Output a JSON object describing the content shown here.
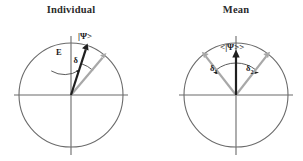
{
  "figure": {
    "width": 303,
    "height": 161,
    "background": "#ffffff",
    "type": "vector-diagram"
  },
  "colors": {
    "circle_stroke": "#6b6b6b",
    "axis_stroke": "#6b6b6b",
    "arc_stroke": "#4a4a4a",
    "vector_primary": "#1f1f1f",
    "vector_secondary": "#a8a8a8",
    "title_text": "#2b2b2b",
    "label_text": "#1a1a1a"
  },
  "panels": [
    {
      "id": "individual",
      "title": "Individual",
      "title_x": 71,
      "title_y": 13,
      "circle": {
        "cx": 71,
        "cy": 95,
        "r": 52
      },
      "axes": {
        "horizontal": {
          "x1": 14,
          "y1": 95,
          "x2": 128,
          "y2": 95
        },
        "vertical": {
          "x1": 71,
          "y1": 36,
          "x2": 71,
          "y2": 155
        }
      },
      "vectors": [
        {
          "name": "psi-vector",
          "style": "black",
          "angle_deg": 72,
          "length": 48,
          "label": "|Ψ>",
          "label_x": 84,
          "label_y": 38
        },
        {
          "name": "reference-vector",
          "style": "gray",
          "angle_deg": 48,
          "length": 50,
          "label": "",
          "label_x": 0,
          "label_y": 0
        }
      ],
      "arcs": [
        {
          "name": "E-arc",
          "label": "E",
          "label_x": 59,
          "label_y": 54,
          "r": 26,
          "start_deg": 72,
          "end_deg": 112
        },
        {
          "name": "delta-arc",
          "label": "δ",
          "label_x": 76,
          "label_y": 62,
          "r": 33,
          "start_deg": 48,
          "end_deg": 72
        }
      ]
    },
    {
      "id": "mean",
      "title": "Mean",
      "title_x": 236,
      "title_y": 13,
      "circle": {
        "cx": 236,
        "cy": 95,
        "r": 52
      },
      "axes": {
        "horizontal": {
          "x1": 179,
          "y1": 95,
          "x2": 293,
          "y2": 95
        },
        "vertical": {
          "x1": 236,
          "y1": 36,
          "x2": 236,
          "y2": 155
        }
      },
      "vectors": [
        {
          "name": "mean-psi-vector",
          "style": "black",
          "angle_deg": 90,
          "length": 45,
          "label": "<|Ψ>>",
          "label_x": 237,
          "label_y": 49
        },
        {
          "name": "component-vector-1",
          "style": "gray",
          "angle_deg": 128,
          "length": 49,
          "label": "",
          "label_x": 0,
          "label_y": 0
        },
        {
          "name": "component-vector-2",
          "style": "gray",
          "angle_deg": 52,
          "length": 49,
          "label": "",
          "label_x": 0,
          "label_y": 0
        }
      ],
      "arcs": [
        {
          "name": "delta1-arc",
          "label": "δ",
          "sub": "1",
          "label_x": 214,
          "label_y": 70,
          "r": 32,
          "start_deg": 90,
          "end_deg": 128
        },
        {
          "name": "delta2-arc",
          "label": "δ",
          "sub": "2",
          "label_x": 249,
          "label_y": 70,
          "r": 32,
          "start_deg": 52,
          "end_deg": 90
        }
      ]
    }
  ]
}
